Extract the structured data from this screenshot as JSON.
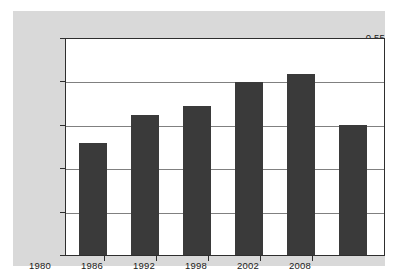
{
  "chart_data": {
    "type": "bar",
    "title": "",
    "subtitle": "",
    "xlabel": "",
    "ylabel": "",
    "categories": [
      "1980",
      "1986",
      "1992",
      "1998",
      "2002",
      "2008"
    ],
    "values": [
      0.502,
      0.515,
      0.519,
      0.53,
      0.534,
      0.51
    ],
    "series": [
      {
        "name": "",
        "values": [
          0.502,
          0.515,
          0.519,
          0.53,
          0.534,
          0.51
        ]
      }
    ],
    "ylim": [
      0.45,
      0.55
    ],
    "ytick_values": [
      0.45,
      0.47,
      0.49,
      0.51,
      0.53,
      0.55
    ],
    "ytick_labels": [
      "0.45",
      "0.47",
      "0.49",
      "0.51",
      "0.53",
      "0.55"
    ],
    "xtick_labels": [
      "1980",
      "1986",
      "1992",
      "1998",
      "2002",
      "2008"
    ],
    "grid": true,
    "grid_axis": "y",
    "legend": false,
    "legend_position": "none",
    "annotations": [],
    "colors": {
      "bar_fill": "#3a3a3a",
      "panel_background": "#d9d9d9",
      "plot_background": "#ffffff",
      "axis_line": "#2e2e2e",
      "gridline": "#808080",
      "tick_label": "#1a1a1a"
    }
  }
}
